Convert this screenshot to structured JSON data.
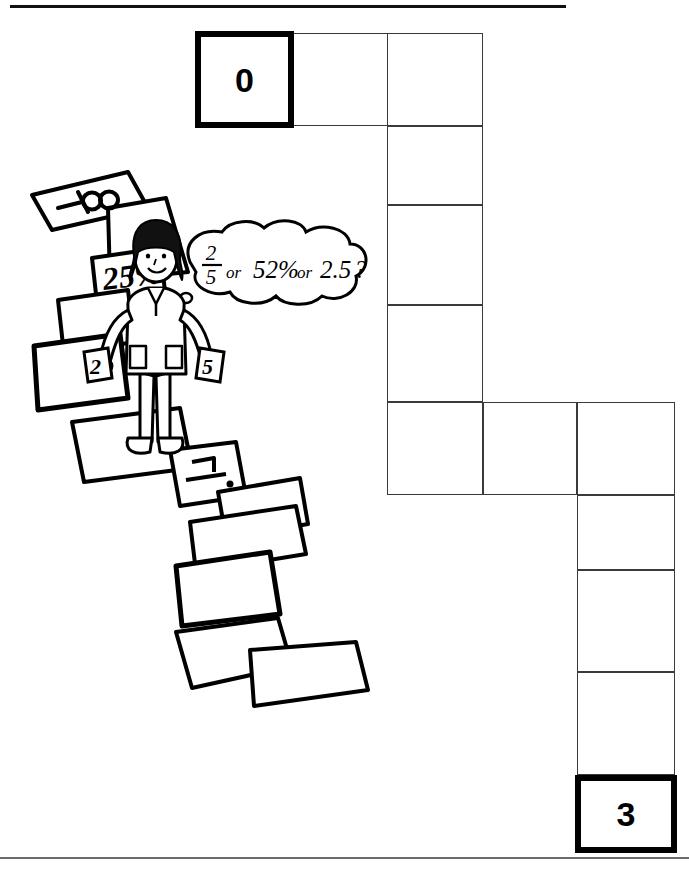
{
  "page": {
    "width": 689,
    "height": 871,
    "background": "#ffffff",
    "ink_color": "#000000",
    "grid_line_color": "#3a3a3a"
  },
  "rules": {
    "top_rule": "horizontal-rule-top",
    "bottom_rule": "horizontal-rule-bottom"
  },
  "board": {
    "start_cell_label": "0",
    "end_cell_label": "3",
    "cells": [
      {
        "id": "start",
        "label": "0",
        "x": 195,
        "y": 31,
        "w": 99,
        "h": 97,
        "endpoint": true
      },
      {
        "id": "r1c2",
        "label": "",
        "x": 293,
        "y": 33,
        "w": 95,
        "h": 93,
        "endpoint": false
      },
      {
        "id": "r1c3",
        "label": "",
        "x": 387,
        "y": 33,
        "w": 96,
        "h": 93,
        "endpoint": false
      },
      {
        "id": "r2c3",
        "label": "",
        "x": 387,
        "y": 126,
        "w": 96,
        "h": 79,
        "endpoint": false
      },
      {
        "id": "r3c3",
        "label": "",
        "x": 387,
        "y": 205,
        "w": 96,
        "h": 100,
        "endpoint": false
      },
      {
        "id": "r4c3",
        "label": "",
        "x": 387,
        "y": 305,
        "w": 96,
        "h": 97,
        "endpoint": false
      },
      {
        "id": "r5c3",
        "label": "",
        "x": 387,
        "y": 402,
        "w": 96,
        "h": 93,
        "endpoint": false
      },
      {
        "id": "r5c4",
        "label": "",
        "x": 483,
        "y": 402,
        "w": 94,
        "h": 93,
        "endpoint": false
      },
      {
        "id": "r5c5",
        "label": "",
        "x": 577,
        "y": 402,
        "w": 98,
        "h": 93,
        "endpoint": false
      },
      {
        "id": "r6c5",
        "label": "",
        "x": 577,
        "y": 495,
        "w": 98,
        "h": 75,
        "endpoint": false
      },
      {
        "id": "r7c5",
        "label": "",
        "x": 577,
        "y": 570,
        "w": 98,
        "h": 102,
        "endpoint": false
      },
      {
        "id": "r8c5",
        "label": "",
        "x": 577,
        "y": 672,
        "w": 98,
        "h": 103,
        "endpoint": false
      },
      {
        "id": "end",
        "label": "3",
        "x": 575,
        "y": 775,
        "w": 102,
        "h": 78,
        "endpoint": true
      }
    ]
  },
  "illustration": {
    "title": "girl-on-stepping-stones",
    "thought_bubble": {
      "fraction_numerator": "2",
      "fraction_denominator": "5",
      "connector_one": "or",
      "percent_value": "52%",
      "connector_two": "or",
      "decimal_value": "2.5",
      "question_mark": "?"
    },
    "stones": [
      {
        "id": "stone-neg-infinity",
        "label": "—⁄∞"
      },
      {
        "id": "stone-blank-1",
        "label": ""
      },
      {
        "id": "stone-25-percent",
        "label": "25%"
      },
      {
        "id": "stone-blank-2",
        "label": ""
      },
      {
        "id": "stone-blank-3",
        "label": ""
      },
      {
        "id": "stone-under-feet",
        "label": ""
      },
      {
        "id": "stone-fraction-mark",
        "label": ""
      },
      {
        "id": "stone-blank-4",
        "label": ""
      },
      {
        "id": "stone-blank-5",
        "label": ""
      },
      {
        "id": "stone-blank-6",
        "label": ""
      },
      {
        "id": "stone-blank-7",
        "label": ""
      },
      {
        "id": "stone-blank-8",
        "label": ""
      }
    ],
    "held_cards": {
      "left_card": "2",
      "right_card": "5"
    }
  }
}
